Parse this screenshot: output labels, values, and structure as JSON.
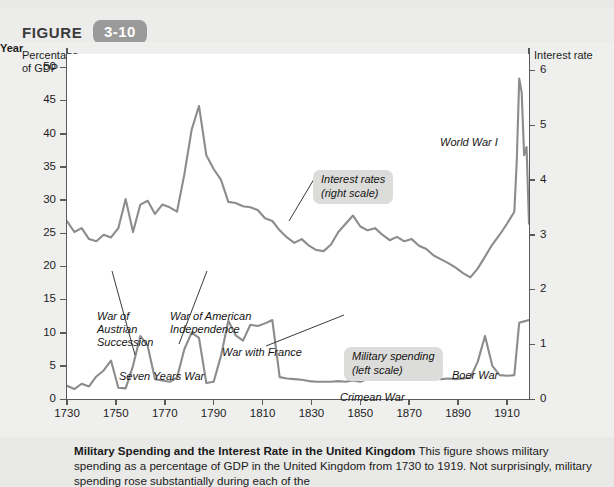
{
  "figure": {
    "label": "FIGURE",
    "number": "3-10"
  },
  "chart_data": {
    "type": "line",
    "title": "Military Spending and the Interest Rate in the United Kingdom",
    "xlabel": "Year",
    "ylabel_left": "Percentage\nof GDP",
    "ylabel_right": "Interest rate",
    "xlim": [
      1730,
      1919
    ],
    "ylim_left": [
      0,
      52
    ],
    "ylim_right": [
      0,
      6.3
    ],
    "xticks": [
      1730,
      1750,
      1770,
      1790,
      1810,
      1830,
      1850,
      1870,
      1890,
      1910
    ],
    "yticks_left": [
      0,
      5,
      10,
      15,
      20,
      25,
      30,
      35,
      40,
      45,
      50
    ],
    "yticks_right": [
      0,
      1,
      2,
      3,
      4,
      5,
      6
    ],
    "grid": false,
    "legend_position": "inline-callouts",
    "series": [
      {
        "name": "Interest rates (right scale)",
        "scale": "right",
        "color": "#8c8c8c",
        "x": [
          1730,
          1733,
          1736,
          1739,
          1742,
          1745,
          1748,
          1751,
          1754,
          1757,
          1760,
          1763,
          1766,
          1769,
          1772,
          1775,
          1778,
          1781,
          1784,
          1787,
          1790,
          1793,
          1796,
          1799,
          1802,
          1805,
          1808,
          1811,
          1814,
          1817,
          1820,
          1823,
          1826,
          1829,
          1832,
          1835,
          1838,
          1841,
          1844,
          1847,
          1850,
          1853,
          1856,
          1859,
          1862,
          1865,
          1868,
          1871,
          1874,
          1877,
          1880,
          1883,
          1886,
          1889,
          1892,
          1895,
          1898,
          1901,
          1904,
          1907,
          1910,
          1913,
          1914,
          1915,
          1916,
          1917,
          1918,
          1919
        ],
        "y": [
          3.25,
          3.05,
          3.12,
          2.92,
          2.88,
          3.0,
          2.95,
          3.12,
          3.65,
          3.05,
          3.55,
          3.62,
          3.38,
          3.55,
          3.5,
          3.42,
          4.1,
          4.92,
          5.35,
          4.45,
          4.2,
          4.0,
          3.6,
          3.58,
          3.52,
          3.5,
          3.45,
          3.3,
          3.25,
          3.08,
          2.95,
          2.85,
          2.92,
          2.8,
          2.72,
          2.7,
          2.82,
          3.05,
          3.2,
          3.35,
          3.15,
          3.08,
          3.12,
          3.0,
          2.9,
          2.96,
          2.88,
          2.92,
          2.8,
          2.74,
          2.62,
          2.55,
          2.48,
          2.4,
          2.3,
          2.22,
          2.38,
          2.6,
          2.82,
          3.0,
          3.2,
          3.42,
          4.35,
          5.85,
          5.6,
          4.45,
          4.6,
          3.2
        ]
      },
      {
        "name": "Military spending (left scale)",
        "scale": "left",
        "color": "#8c8c8c",
        "x": [
          1730,
          1733,
          1736,
          1739,
          1742,
          1745,
          1748,
          1751,
          1754,
          1757,
          1760,
          1763,
          1766,
          1769,
          1772,
          1775,
          1778,
          1781,
          1784,
          1787,
          1790,
          1793,
          1796,
          1799,
          1802,
          1805,
          1808,
          1811,
          1814,
          1817,
          1820,
          1823,
          1826,
          1829,
          1832,
          1835,
          1838,
          1841,
          1844,
          1847,
          1850,
          1853,
          1856,
          1859,
          1862,
          1865,
          1868,
          1871,
          1874,
          1877,
          1880,
          1883,
          1886,
          1889,
          1892,
          1895,
          1898,
          1901,
          1904,
          1907,
          1910,
          1913,
          1915,
          1916,
          1917,
          1918,
          1919
        ],
        "y": [
          2.0,
          1.5,
          2.3,
          1.9,
          3.4,
          4.3,
          5.8,
          1.7,
          1.6,
          5.0,
          9.5,
          8.0,
          3.0,
          2.8,
          2.6,
          3.2,
          7.5,
          10.0,
          9.2,
          2.4,
          2.6,
          6.5,
          11.8,
          9.6,
          8.8,
          11.2,
          11.0,
          11.4,
          11.9,
          3.3,
          3.1,
          3.0,
          2.9,
          2.7,
          2.6,
          2.6,
          2.6,
          2.7,
          2.6,
          2.8,
          2.6,
          3.0,
          6.3,
          3.7,
          4.1,
          3.4,
          3.0,
          3.2,
          3.0,
          3.1,
          3.2,
          3.0,
          3.1,
          3.0,
          3.1,
          3.2,
          5.6,
          9.5,
          5.0,
          3.6,
          3.5,
          3.6,
          11.5,
          11.6,
          11.7,
          11.8,
          11.9
        ]
      }
    ],
    "annotations": [
      {
        "id": "war-of-austrian-succession",
        "text": "War of\nAustrian\nSuccession",
        "style": "plain",
        "x": 97,
        "y": 268
      },
      {
        "id": "seven-years-war",
        "text": "Seven Years War",
        "style": "plain",
        "x": 119,
        "y": 328
      },
      {
        "id": "war-of-american-independence",
        "text": "War of American\nIndependence",
        "style": "plain",
        "x": 170,
        "y": 268
      },
      {
        "id": "war-with-france",
        "text": "War with France",
        "style": "plain",
        "x": 222,
        "y": 304
      },
      {
        "id": "crimean-war",
        "text": "Crimean War",
        "style": "plain",
        "x": 340,
        "y": 349
      },
      {
        "id": "boer-war",
        "text": "Boer War",
        "style": "plain",
        "x": 452,
        "y": 327
      },
      {
        "id": "world-war-i",
        "text": "World War I",
        "style": "plain",
        "x": 440,
        "y": 94
      },
      {
        "id": "interest-rates-callout",
        "text": "Interest rates\n(right scale)",
        "style": "callout",
        "x": 313,
        "y": 128
      },
      {
        "id": "military-spending-callout",
        "text": "Military spending\n(left scale)",
        "style": "callout",
        "x": 344,
        "y": 305
      }
    ]
  },
  "caption": {
    "title": "Military Spending and the Interest Rate in the United Kingdom",
    "body": "This figure shows military spending as a percentage of GDP in the United Kingdom from 1730 to 1919. Not surprisingly, military spending rose substantially during each of the"
  }
}
